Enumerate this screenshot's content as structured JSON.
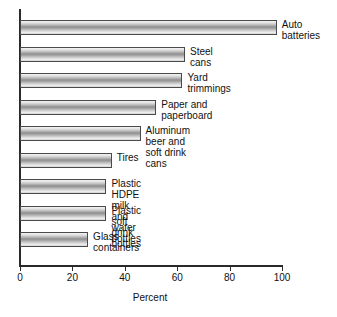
{
  "chart_data": {
    "type": "bar",
    "orientation": "horizontal",
    "title": "",
    "subtitle": "",
    "xlabel": "Percent",
    "ylabel": "",
    "xlim": [
      0,
      100
    ],
    "xticks": [
      0,
      20,
      40,
      60,
      80,
      100
    ],
    "xtick_labels": [
      "0",
      "20",
      "40",
      "60",
      "80",
      "100"
    ],
    "grid": false,
    "legend": false,
    "legend_position": "none",
    "categories": [
      "Auto batteries",
      "Steel cans",
      "Yard trimmings",
      "Paper and paperboard",
      "Aluminum beer and soft drink cans",
      "Tires",
      "Plastic HDPE milk and water bottles",
      "Plastic soft drink bottles",
      "Glass containers"
    ],
    "values": [
      98,
      63,
      62,
      52,
      46,
      35,
      33,
      33,
      26
    ],
    "bars": [
      {
        "label": "Auto batteries",
        "label_display": "Auto\nbatteries",
        "value": 98
      },
      {
        "label": "Steel cans",
        "label_display": "Steel cans",
        "value": 63
      },
      {
        "label": "Yard trimmings",
        "label_display": "Yard trimmings",
        "value": 62
      },
      {
        "label": "Paper and paperboard",
        "label_display": "Paper and paperboard",
        "value": 52
      },
      {
        "label": "Aluminum beer and soft drink cans",
        "label_display": "Aluminum beer and soft drink cans",
        "value": 46
      },
      {
        "label": "Tires",
        "label_display": "Tires",
        "value": 35
      },
      {
        "label": "Plastic HDPE milk and water bottles",
        "label_display": "Plastic HDPE milk and water bottles",
        "value": 33
      },
      {
        "label": "Plastic soft drink bottles",
        "label_display": "Plastic soft drink bottles",
        "value": 33
      },
      {
        "label": "Glass containers",
        "label_display": "Glass containers",
        "value": 26
      }
    ],
    "colors": {
      "bar_light": "#f2f2f2",
      "bar_mid": "#8e8e8e",
      "bar_edge": "#4a4a4a",
      "axis": "#2a2a2a",
      "text": "#111111",
      "background": "#ffffff"
    }
  }
}
